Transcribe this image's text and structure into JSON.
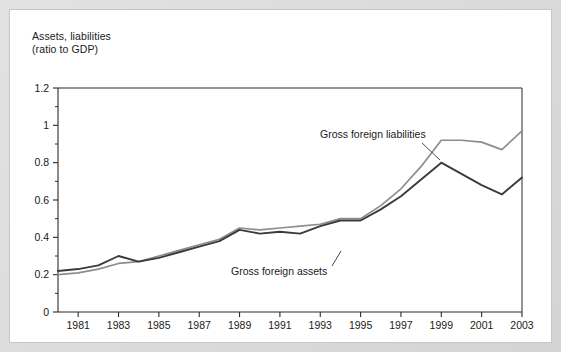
{
  "figure": {
    "axis_title_line1": "Assets, liabilities",
    "axis_title_line2": "(ratio to GDP)"
  },
  "chart_data": {
    "type": "line",
    "xlabel": "",
    "ylabel": "Assets, liabilities (ratio to GDP)",
    "ylim": [
      0,
      1.2
    ],
    "xlim": [
      1980,
      2003
    ],
    "grid": false,
    "legend_position": "inline-annotations",
    "y_ticks_major": [
      0,
      0.2,
      0.4,
      0.6,
      0.8,
      1,
      1.2
    ],
    "y_tick_labels": [
      "0",
      "0.2",
      "0.4",
      "0.6",
      "0.8",
      "1",
      "1.2"
    ],
    "y_ticks_minor": [
      0.1,
      0.3,
      0.5,
      0.7,
      0.9,
      1.1
    ],
    "x_ticks": [
      1981,
      1983,
      1985,
      1987,
      1989,
      1991,
      1993,
      1995,
      1997,
      1999,
      2001,
      2003
    ],
    "x_tick_labels": [
      "1981",
      "1983",
      "1985",
      "1987",
      "1989",
      "1991",
      "1993",
      "1995",
      "1997",
      "1999",
      "2001",
      "2003"
    ],
    "x": [
      1980,
      1981,
      1982,
      1983,
      1984,
      1985,
      1986,
      1987,
      1988,
      1989,
      1990,
      1991,
      1992,
      1993,
      1994,
      1995,
      1996,
      1997,
      1998,
      1999,
      2000,
      2001,
      2002,
      2003
    ],
    "series": [
      {
        "name": "Gross foreign assets",
        "color": "#3b3b3b",
        "values": [
          0.22,
          0.23,
          0.25,
          0.3,
          0.27,
          0.29,
          0.32,
          0.35,
          0.38,
          0.44,
          0.42,
          0.43,
          0.42,
          0.46,
          0.49,
          0.49,
          0.55,
          0.62,
          0.71,
          0.8,
          0.74,
          0.68,
          0.63,
          0.72
        ],
        "annotation": "Gross foreign assets"
      },
      {
        "name": "Gross foreign liabilities",
        "color": "#8d8d8d",
        "values": [
          0.2,
          0.21,
          0.23,
          0.26,
          0.27,
          0.3,
          0.33,
          0.36,
          0.39,
          0.45,
          0.44,
          0.45,
          0.46,
          0.47,
          0.5,
          0.5,
          0.57,
          0.66,
          0.78,
          0.92,
          0.92,
          0.91,
          0.87,
          0.97
        ],
        "annotation": "Gross foreign liabilities"
      }
    ],
    "annotations": [
      {
        "text": "Gross foreign liabilities",
        "target_series": "Gross foreign liabilities"
      },
      {
        "text": "Gross foreign assets",
        "target_series": "Gross foreign assets"
      }
    ]
  }
}
